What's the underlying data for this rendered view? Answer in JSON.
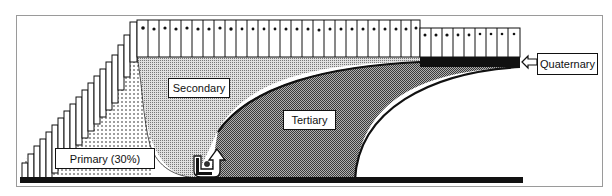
{
  "diagram": {
    "type": "layered-filtration-stages",
    "labels": {
      "primary": "Primary (30%)",
      "secondary": "Secondary",
      "tertiary": "Tertiary",
      "quaternary": "Quaternary"
    },
    "colors": {
      "frame": "#9a9a9a",
      "ink": "#111111",
      "primary_fill": "#ffffff",
      "secondary_fill": "#c8c8c8",
      "tertiary_fill": "#8a8a8a",
      "quaternary_bar": "#111111",
      "base_bar": "#111111"
    },
    "stair_columns_count": 16,
    "top_row_columns_count": 27,
    "lower_row_columns_count": 9
  }
}
